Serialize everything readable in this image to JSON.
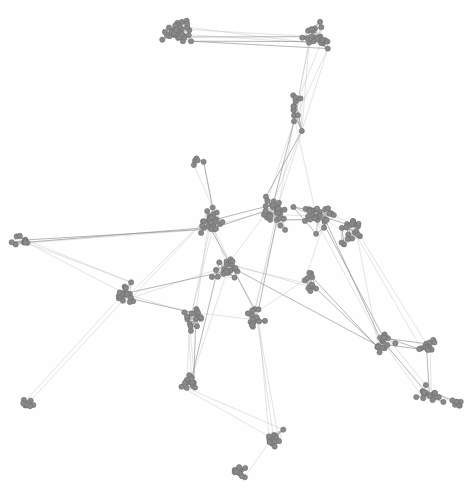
{
  "figure": {
    "type": "network-graph",
    "title": "",
    "width": 473,
    "height": 499,
    "background_color": "#fefefe",
    "layout": "force-directed"
  },
  "style": {
    "node_fill": "#8a8a8a",
    "node_stroke": "#6e6e6e",
    "node_radius": 2.6,
    "node_stroke_width": 0.6,
    "edge_color": "#b9b9b9",
    "edge_color_strong": "#8f8f8f",
    "edge_width": 0.45,
    "edge_opacity": 0.85
  },
  "chart_data": {
    "type": "scatter",
    "title": "",
    "xlabel": "",
    "ylabel": "",
    "xlim": [
      0,
      473
    ],
    "ylim": [
      0,
      499
    ],
    "grid": false,
    "legend": null,
    "node_count": 402,
    "edge_count": 520,
    "clusters": [
      {
        "name": "top-left-hub",
        "cx": 178,
        "cy": 33,
        "rx": 24,
        "ry": 21,
        "n": 34
      },
      {
        "name": "top-right-branch",
        "cx": 318,
        "cy": 38,
        "rx": 24,
        "ry": 24,
        "n": 22
      },
      {
        "name": "upper-stem",
        "cx": 296,
        "cy": 110,
        "rx": 14,
        "ry": 30,
        "n": 12
      },
      {
        "name": "mid-isolate",
        "cx": 196,
        "cy": 162,
        "rx": 11,
        "ry": 8,
        "n": 5
      },
      {
        "name": "core-left",
        "cx": 212,
        "cy": 222,
        "rx": 22,
        "ry": 20,
        "n": 28
      },
      {
        "name": "core-center",
        "cx": 272,
        "cy": 212,
        "rx": 24,
        "ry": 22,
        "n": 30
      },
      {
        "name": "core-right",
        "cx": 320,
        "cy": 216,
        "rx": 28,
        "ry": 20,
        "n": 32
      },
      {
        "name": "right-fan",
        "cx": 353,
        "cy": 228,
        "rx": 20,
        "ry": 22,
        "n": 20
      },
      {
        "name": "left-edge-blob",
        "cx": 22,
        "cy": 240,
        "rx": 14,
        "ry": 12,
        "n": 11
      },
      {
        "name": "left-mid-blob",
        "cx": 126,
        "cy": 292,
        "rx": 17,
        "ry": 18,
        "n": 18
      },
      {
        "name": "center-low",
        "cx": 228,
        "cy": 268,
        "rx": 20,
        "ry": 18,
        "n": 20
      },
      {
        "name": "right-low-a",
        "cx": 312,
        "cy": 284,
        "rx": 13,
        "ry": 16,
        "n": 12
      },
      {
        "name": "mid-low-a",
        "cx": 194,
        "cy": 320,
        "rx": 18,
        "ry": 14,
        "n": 18
      },
      {
        "name": "mid-low-b",
        "cx": 256,
        "cy": 318,
        "rx": 16,
        "ry": 14,
        "n": 15
      },
      {
        "name": "bottom-left-blob",
        "cx": 190,
        "cy": 382,
        "rx": 15,
        "ry": 16,
        "n": 16
      },
      {
        "name": "bottom-isolate",
        "cx": 26,
        "cy": 404,
        "rx": 12,
        "ry": 10,
        "n": 9
      },
      {
        "name": "right-chain-a",
        "cx": 383,
        "cy": 344,
        "rx": 16,
        "ry": 13,
        "n": 15
      },
      {
        "name": "right-chain-b",
        "cx": 424,
        "cy": 346,
        "rx": 15,
        "ry": 12,
        "n": 14
      },
      {
        "name": "right-chain-c",
        "cx": 430,
        "cy": 394,
        "rx": 18,
        "ry": 16,
        "n": 18
      },
      {
        "name": "bottom-chain-a",
        "cx": 274,
        "cy": 438,
        "rx": 13,
        "ry": 16,
        "n": 14
      },
      {
        "name": "bottom-tail",
        "cx": 241,
        "cy": 472,
        "rx": 11,
        "ry": 14,
        "n": 12
      },
      {
        "name": "far-right-low",
        "cx": 456,
        "cy": 404,
        "rx": 10,
        "ry": 10,
        "n": 7
      }
    ],
    "long_edges": [
      [
        178,
        33,
        318,
        38
      ],
      [
        178,
        33,
        300,
        60
      ],
      [
        190,
        40,
        330,
        52
      ],
      [
        318,
        38,
        296,
        110
      ],
      [
        300,
        58,
        288,
        120
      ],
      [
        318,
        50,
        300,
        130
      ],
      [
        296,
        120,
        276,
        200
      ],
      [
        290,
        135,
        268,
        196
      ],
      [
        300,
        128,
        284,
        190
      ],
      [
        196,
        162,
        218,
        200
      ],
      [
        200,
        166,
        212,
        210
      ],
      [
        22,
        240,
        130,
        236
      ],
      [
        22,
        244,
        206,
        228
      ],
      [
        26,
        248,
        128,
        290
      ],
      [
        26,
        404,
        120,
        300
      ],
      [
        126,
        292,
        212,
        222
      ],
      [
        126,
        292,
        194,
        320
      ],
      [
        130,
        298,
        228,
        268
      ],
      [
        212,
        222,
        272,
        212
      ],
      [
        272,
        212,
        320,
        216
      ],
      [
        320,
        216,
        353,
        228
      ],
      [
        228,
        268,
        312,
        284
      ],
      [
        228,
        268,
        383,
        344
      ],
      [
        212,
        230,
        256,
        318
      ],
      [
        194,
        320,
        190,
        382
      ],
      [
        194,
        320,
        256,
        318
      ],
      [
        190,
        382,
        274,
        438
      ],
      [
        256,
        318,
        274,
        438
      ],
      [
        274,
        438,
        241,
        472
      ],
      [
        320,
        216,
        383,
        344
      ],
      [
        353,
        228,
        424,
        346
      ],
      [
        383,
        344,
        424,
        346
      ],
      [
        383,
        344,
        430,
        394
      ],
      [
        424,
        346,
        430,
        394
      ],
      [
        430,
        394,
        456,
        404
      ],
      [
        312,
        284,
        383,
        344
      ],
      [
        272,
        212,
        228,
        268
      ],
      [
        212,
        222,
        228,
        268
      ],
      [
        126,
        292,
        22,
        240
      ],
      [
        194,
        320,
        126,
        292
      ],
      [
        256,
        318,
        312,
        284
      ],
      [
        190,
        382,
        194,
        320
      ],
      [
        274,
        438,
        290,
        400
      ],
      [
        241,
        472,
        238,
        490
      ],
      [
        320,
        216,
        312,
        284
      ],
      [
        353,
        228,
        383,
        344
      ],
      [
        212,
        222,
        194,
        320
      ],
      [
        272,
        212,
        256,
        318
      ],
      [
        228,
        268,
        190,
        382
      ],
      [
        296,
        110,
        320,
        216
      ]
    ]
  }
}
